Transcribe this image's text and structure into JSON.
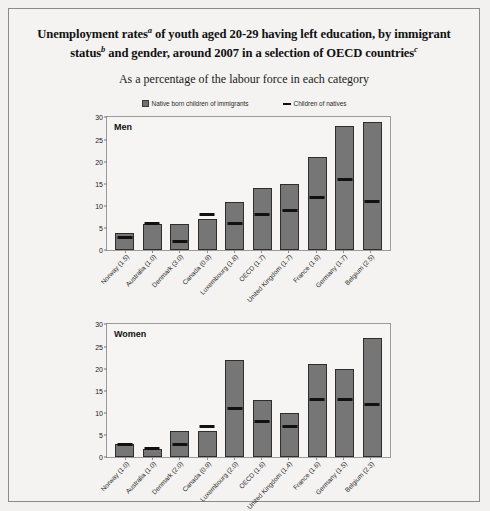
{
  "figure": {
    "title_parts": {
      "line1_a": "Unemployment rates",
      "sup_a": "a",
      "line1_b": " of youth aged 20-29 having left education, by immigrant",
      "line2_a": "status",
      "sup_b": "b",
      "line2_b": " and gender, around 2007 in a selection of OECD countries",
      "sup_c": "c"
    },
    "subtitle": "As a percentage of the labour force in each category",
    "legend": [
      {
        "name": "legend-native-born-children-of-immigrants",
        "label": "Native born children of immigrants",
        "type": "bar",
        "color": "#767676"
      },
      {
        "name": "legend-children-of-natives",
        "label": "Children of natives",
        "type": "line",
        "color": "#111111"
      }
    ]
  },
  "chart_data": [
    {
      "type": "bar",
      "title": "Men",
      "panel_label": "Men",
      "xlabel": "",
      "ylabel": "",
      "ylim": [
        0,
        30
      ],
      "yticks": [
        0,
        5,
        10,
        15,
        20,
        25,
        30
      ],
      "grid": false,
      "legend_position": "top-center",
      "categories": [
        "Norway (1.5)",
        "Australia (1.0)",
        "Denmark (3.0)",
        "Canada (0.9)",
        "Luxembourg (1.8)",
        "OECD (1.7)",
        "United Kingdom (1.7)",
        "France (1.6)",
        "Germany (1.7)",
        "Belgium (2.5)"
      ],
      "series": [
        {
          "name": "Native born children of immigrants",
          "values": [
            4,
            6,
            6,
            7,
            11,
            14,
            15,
            21,
            28,
            29
          ]
        },
        {
          "name": "Children of natives",
          "values": [
            3,
            6,
            2,
            8,
            6,
            8,
            9,
            12,
            16,
            11
          ]
        }
      ]
    },
    {
      "type": "bar",
      "title": "Women",
      "panel_label": "Women",
      "xlabel": "",
      "ylabel": "",
      "ylim": [
        0,
        30
      ],
      "yticks": [
        0,
        5,
        10,
        15,
        20,
        25,
        30
      ],
      "grid": false,
      "legend_position": "top-center",
      "categories": [
        "Norway (1.0)",
        "Australia (1.0)",
        "Denmark (2.0)",
        "Canada (0.9)",
        "Luxembourg (2.0)",
        "OECD (1.6)",
        "United Kingdom (1.4)",
        "France (1.6)",
        "Germany (1.5)",
        "Belgium (2.3)"
      ],
      "series": [
        {
          "name": "Native born children of immigrants",
          "values": [
            3,
            2,
            6,
            6,
            22,
            13,
            10,
            21,
            20,
            27
          ]
        },
        {
          "name": "Children of natives",
          "values": [
            3,
            2,
            3,
            7,
            11,
            8,
            7,
            13,
            13,
            12
          ]
        }
      ]
    }
  ]
}
